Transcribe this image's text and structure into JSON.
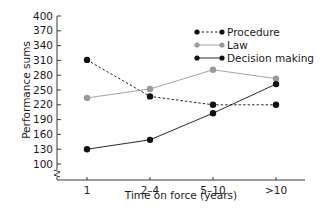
{
  "chart_data": {
    "type": "line",
    "title": "",
    "xlabel": "Time on force (years)",
    "ylabel": "Performance sums",
    "categories": [
      "1",
      "2–4",
      "5–10",
      ">10"
    ],
    "y_ticks": [
      100,
      130,
      160,
      190,
      220,
      250,
      280,
      310,
      340,
      370,
      400
    ],
    "y_tick_labels": [
      "100",
      "130",
      "160",
      "190",
      "220",
      "250",
      "280",
      "310",
      "340",
      "370",
      "400"
    ],
    "ylim": [
      100,
      400
    ],
    "y_axis_break": true,
    "grid": false,
    "legend_position": "top-right",
    "series": [
      {
        "name": "Procedure",
        "values": [
          311,
          237,
          220,
          220
        ],
        "color": "#111111",
        "line_style": "dashed",
        "marker": "filled-circle"
      },
      {
        "name": "Law",
        "values": [
          234,
          252,
          291,
          273
        ],
        "color": "#9a9a9a",
        "line_style": "solid",
        "marker": "filled-circle"
      },
      {
        "name": "Decision making",
        "values": [
          130,
          149,
          203,
          262
        ],
        "color": "#111111",
        "line_style": "solid",
        "marker": "filled-circle"
      }
    ]
  }
}
